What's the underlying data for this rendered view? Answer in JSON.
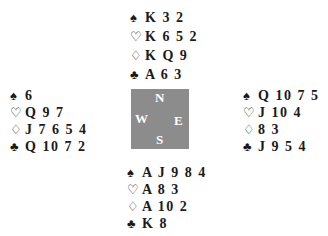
{
  "suits": {
    "spades": "♠",
    "hearts": "♡",
    "diamonds": "♢",
    "clubs": "♣"
  },
  "compass": {
    "north": "N",
    "south": "S",
    "east": "E",
    "west": "W",
    "color": "#8c8c8c"
  },
  "hands": {
    "north": {
      "spades": "K 3 2",
      "hearts": "K 6 5 2",
      "diamonds": "K Q 9",
      "clubs": "A 6 3"
    },
    "west": {
      "spades": "6",
      "hearts": "Q 9 7",
      "diamonds": "J 7 6 5 4",
      "clubs": "Q 10 7 2"
    },
    "east": {
      "spades": "Q 10 7 5",
      "hearts": "J 10 4",
      "diamonds": "8 3",
      "clubs": "J 9 5 4"
    },
    "south": {
      "spades": "A J 9 8 4",
      "hearts": "A 8 3",
      "diamonds": "A 10 2",
      "clubs": "K 8"
    }
  }
}
